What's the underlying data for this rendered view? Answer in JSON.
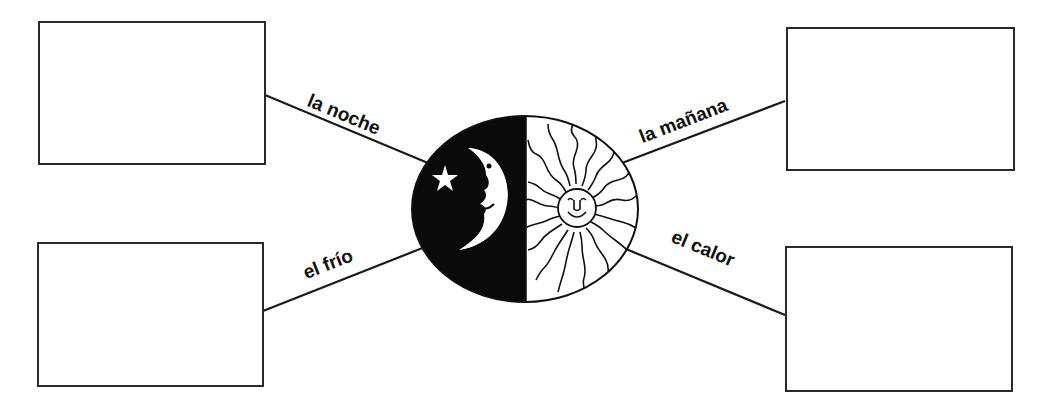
{
  "diagram": {
    "center_image": {
      "left_half": "moon-with-star-night",
      "right_half": "sun-with-wavy-rays-day",
      "fill_dark": "#0a0a0a",
      "fill_light": "#ffffff"
    },
    "branches": [
      {
        "id": "top-left",
        "label": "la noche",
        "box_content": ""
      },
      {
        "id": "top-right",
        "label": "la mañana",
        "box_content": ""
      },
      {
        "id": "bottom-left",
        "label": "el frío",
        "box_content": ""
      },
      {
        "id": "bottom-right",
        "label": "el calor",
        "box_content": ""
      }
    ]
  }
}
